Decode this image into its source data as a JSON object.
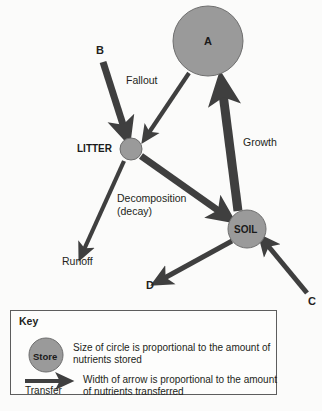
{
  "diagram": {
    "type": "nutrient-cycle-flow-diagram",
    "colors": {
      "store_fill": "#9a9a9a",
      "store_stroke": "#6e6e6e",
      "arrow": "#3f3f3f",
      "text": "#231f20",
      "background": "#fbfbfa",
      "key_border": "#5d5d5d"
    },
    "nodes": [
      {
        "id": "A",
        "label": "A",
        "label_position": "inside",
        "cx": 208,
        "cy": 41,
        "r": 35
      },
      {
        "id": "LITTER",
        "label": "LITTER",
        "label_position": "left",
        "cx": 131,
        "cy": 149,
        "r": 11
      },
      {
        "id": "SOIL",
        "label": "SOIL",
        "label_position": "inside",
        "cx": 247,
        "cy": 229,
        "r": 19
      }
    ],
    "flow_labels": [
      {
        "id": "B",
        "text": "B",
        "bold": true,
        "size": 11
      },
      {
        "id": "C",
        "text": "C",
        "bold": true,
        "size": 11
      },
      {
        "id": "D",
        "text": "D",
        "bold": true,
        "size": 11
      },
      {
        "id": "fallout",
        "text": "Fallout",
        "bold": false,
        "size": 10.5
      },
      {
        "id": "growth",
        "text": "Growth",
        "bold": false,
        "size": 10.5
      },
      {
        "id": "decomposition",
        "text": "Decomposition",
        "bold": false,
        "size": 10.5
      },
      {
        "id": "decay",
        "text": "(decay)",
        "bold": false,
        "size": 10.5
      },
      {
        "id": "runoff",
        "text": "Runoff",
        "bold": false,
        "size": 10.5
      }
    ],
    "arrows": [
      {
        "id": "b-to-litter",
        "from": "B",
        "to": "LITTER",
        "label": "B",
        "width": 7
      },
      {
        "id": "a-to-litter",
        "from": "A",
        "to": "LITTER",
        "label": "Fallout",
        "width": 4
      },
      {
        "id": "soil-to-a",
        "from": "SOIL",
        "to": "A",
        "label": "Growth",
        "width": 9
      },
      {
        "id": "litter-to-soil",
        "from": "LITTER",
        "to": "SOIL",
        "label": "Decomposition (decay)",
        "width": 7
      },
      {
        "id": "litter-to-runoff",
        "from": "LITTER",
        "to": "Runoff",
        "label": "Runoff",
        "width": 4
      },
      {
        "id": "soil-to-d",
        "from": "SOIL",
        "to": "D",
        "label": "D",
        "width": 5
      },
      {
        "id": "c-to-soil",
        "from": "C",
        "to": "SOIL",
        "label": "C",
        "width": 5
      }
    ]
  },
  "key": {
    "title": "Key",
    "store_label": "Store",
    "store_description": "Size of circle is proportional to the amount of nutrients stored",
    "transfer_label": "Transfer",
    "transfer_description": "Width of arrow is proportional to the amount of nutrients transferred"
  }
}
